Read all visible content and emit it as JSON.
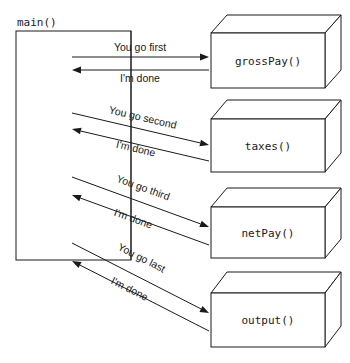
{
  "diagram": {
    "colors": {
      "background": "#ffffff",
      "stroke": "#1a1a1a",
      "face": "#ffffff"
    },
    "caller": {
      "label": "main()",
      "label_x": 17,
      "label_y": 26,
      "rect": {
        "x": 16,
        "y": 31,
        "width": 115,
        "height": 229
      }
    },
    "callees": [
      {
        "id": "grosspay",
        "label": "grossPay()",
        "front": {
          "x": 211,
          "y": 33,
          "width": 114,
          "height": 55
        },
        "depth_x": 16,
        "depth_y": 18
      },
      {
        "id": "taxes",
        "label": "taxes()",
        "front": {
          "x": 211,
          "y": 119,
          "width": 114,
          "height": 53
        },
        "depth_x": 16,
        "depth_y": 19
      },
      {
        "id": "netpay",
        "label": "netPay()",
        "front": {
          "x": 211,
          "y": 207,
          "width": 114,
          "height": 51
        },
        "depth_x": 16,
        "depth_y": 19
      },
      {
        "id": "output",
        "label": "output()",
        "front": {
          "x": 211,
          "y": 293,
          "width": 114,
          "height": 54
        },
        "depth_x": 16,
        "depth_y": 21
      }
    ],
    "messages": [
      {
        "id": "call-1",
        "label": "You go first",
        "direction": "call",
        "x1": 72,
        "y1": 57,
        "x2": 209,
        "y2": 57,
        "label_x": 140,
        "label_y": 51,
        "rotate": 0
      },
      {
        "id": "return-1",
        "label": "I'm done",
        "direction": "return",
        "x1": 209,
        "y1": 70,
        "x2": 72,
        "y2": 70,
        "label_x": 140,
        "label_y": 82,
        "rotate": 0
      },
      {
        "id": "call-2",
        "label": "You go second",
        "direction": "call",
        "x1": 72,
        "y1": 113,
        "x2": 209,
        "y2": 145,
        "label_x": 142,
        "label_y": 121,
        "rotate": 13.2
      },
      {
        "id": "return-2",
        "label": "I'm done",
        "direction": "return",
        "x1": 209,
        "y1": 161,
        "x2": 72,
        "y2": 129,
        "label_x": 135,
        "label_y": 152,
        "rotate": 13.2
      },
      {
        "id": "call-3",
        "label": "You go third",
        "direction": "call",
        "x1": 72,
        "y1": 177,
        "x2": 209,
        "y2": 227,
        "label_x": 142,
        "label_y": 191,
        "rotate": 20.0
      },
      {
        "id": "return-3",
        "label": "I'm done",
        "direction": "return",
        "x1": 209,
        "y1": 245,
        "x2": 72,
        "y2": 195,
        "label_x": 132,
        "label_y": 222,
        "rotate": 20.0
      },
      {
        "id": "call-4",
        "label": "You go last",
        "direction": "call",
        "x1": 72,
        "y1": 243,
        "x2": 209,
        "y2": 313,
        "label_x": 140,
        "label_y": 261,
        "rotate": 27.0
      },
      {
        "id": "return-4",
        "label": "I'm done",
        "direction": "return",
        "x1": 209,
        "y1": 331,
        "x2": 72,
        "y2": 261,
        "label_x": 128,
        "label_y": 292,
        "rotate": 27.0
      }
    ],
    "lifeline": {
      "x": 131,
      "y1": 31,
      "y2": 260
    }
  }
}
